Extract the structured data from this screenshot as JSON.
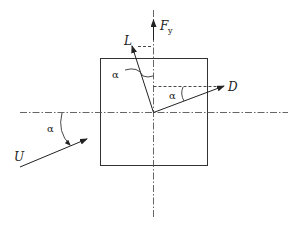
{
  "diagram": {
    "type": "force-vector-diagram",
    "labels": {
      "fy": "F",
      "fy_sub": "y",
      "lift": "L",
      "drag": "D",
      "velocity": "U",
      "angle_lift": "α",
      "angle_drag": "α",
      "angle_velocity": "α"
    },
    "colors": {
      "stroke": "#333333",
      "axis": "#555555",
      "background": "#ffffff"
    }
  }
}
